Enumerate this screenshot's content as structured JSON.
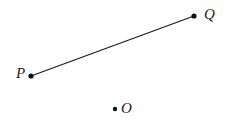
{
  "figure": {
    "width": 229,
    "height": 128,
    "background_color": "#ffffff",
    "stroke_color": "#1a1a1a",
    "points": [
      {
        "id": "P",
        "label": "P",
        "x": 31,
        "y": 76,
        "radius": 2.6,
        "label_x": 16,
        "label_y": 66
      },
      {
        "id": "Q",
        "label": "Q",
        "x": 194,
        "y": 16,
        "radius": 2.6,
        "label_x": 204,
        "label_y": 7
      },
      {
        "id": "O",
        "label": "O",
        "x": 115,
        "y": 109,
        "radius": 2.2,
        "label_x": 121,
        "label_y": 101
      }
    ],
    "segments": [
      {
        "id": "PQ",
        "from": "P",
        "to": "Q",
        "x1": 31,
        "y1": 76,
        "x2": 194,
        "y2": 16,
        "stroke_width": 1.2
      }
    ]
  }
}
